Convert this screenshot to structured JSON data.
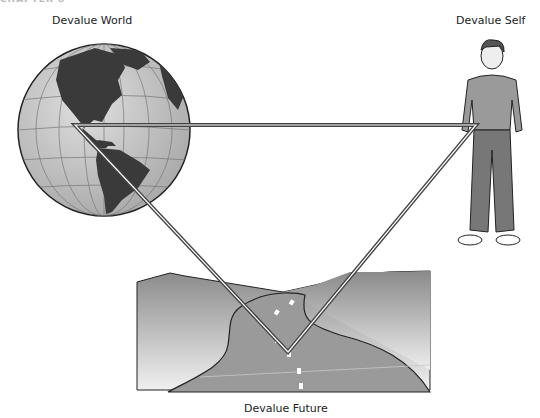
{
  "header": {
    "chapter": "CHAPTER 8"
  },
  "diagram": {
    "nodes": [
      {
        "id": "world",
        "label": "Devalue World",
        "icon": "globe-icon"
      },
      {
        "id": "self",
        "label": "Devalue Self",
        "icon": "person-icon"
      },
      {
        "id": "future",
        "label": "Devalue Future",
        "icon": "road-icon"
      }
    ],
    "edges": [
      {
        "from": "world",
        "to": "self"
      },
      {
        "from": "self",
        "to": "future"
      },
      {
        "from": "future",
        "to": "world"
      }
    ]
  },
  "colors": {
    "line_outer": "#444444",
    "line_inner": "#ffffff",
    "land": "#3a3a3a",
    "ocean": "#c8c8c8",
    "hills": "#8a8a8a",
    "road": "#9a9a9a"
  }
}
